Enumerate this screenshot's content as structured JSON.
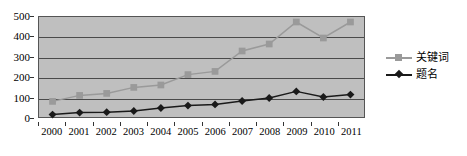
{
  "chart_data": {
    "type": "line",
    "title": "",
    "xlabel": "",
    "ylabel": "",
    "x": [
      2000,
      2001,
      2002,
      2003,
      2004,
      2005,
      2006,
      2007,
      2008,
      2009,
      2010,
      2011
    ],
    "categories": [
      "2000",
      "2001",
      "2002",
      "2003",
      "2004",
      "2005",
      "2006",
      "2007",
      "2008",
      "2009",
      "2010",
      "2011"
    ],
    "series": [
      {
        "name": "关键词",
        "color": "#9a9a9a",
        "marker": "square",
        "values": [
          78,
          108,
          118,
          148,
          160,
          212,
          228,
          330,
          365,
          475,
          395,
          475
        ]
      },
      {
        "name": "题名",
        "color": "#1a1a1a",
        "marker": "diamond",
        "values": [
          12,
          22,
          24,
          30,
          45,
          57,
          63,
          80,
          95,
          128,
          100,
          112
        ]
      }
    ],
    "ylim": [
      0,
      500
    ],
    "yticks": [
      0,
      100,
      200,
      300,
      400,
      500
    ],
    "ytick_labels": [
      "0",
      "100",
      "200",
      "300",
      "400",
      "500"
    ],
    "grid": true,
    "legend_position": "right",
    "plot_background": "#bfbfbf"
  },
  "legend": {
    "items": [
      {
        "label": "关键词"
      },
      {
        "label": "题名"
      }
    ]
  }
}
